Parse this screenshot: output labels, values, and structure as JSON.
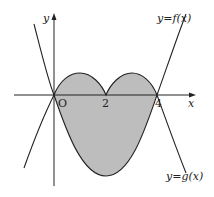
{
  "diagram": {
    "type": "function-graph",
    "axes": {
      "x_label": "x",
      "y_label": "y",
      "origin_label": "O"
    },
    "ticks": {
      "x": [
        "2",
        "4"
      ]
    },
    "curves": [
      {
        "name": "f",
        "label": "y=f(x)"
      },
      {
        "name": "g",
        "label": "y=g(x)"
      }
    ],
    "colors": {
      "shade": "#bdbdbd",
      "stroke": "#222222",
      "background": "#ffffff"
    }
  }
}
